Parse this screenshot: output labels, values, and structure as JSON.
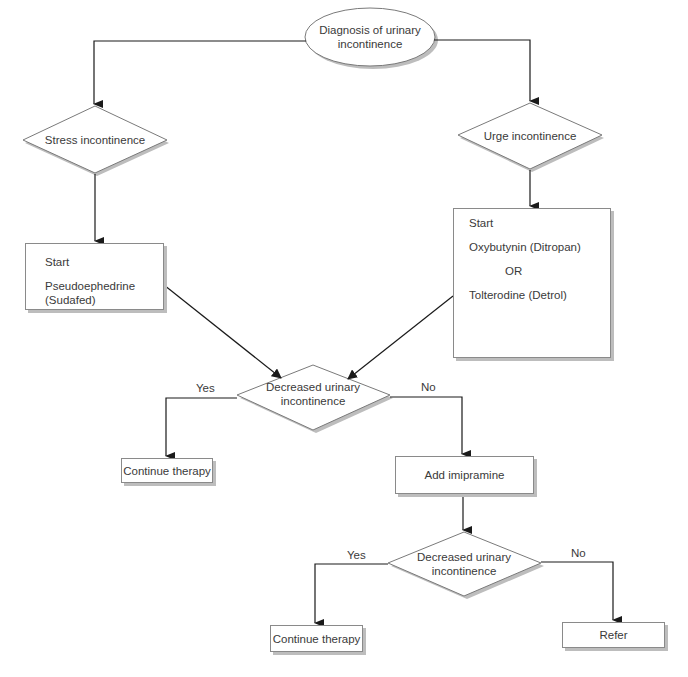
{
  "diagram": {
    "type": "flowchart",
    "start_node": {
      "id": "diagnosis",
      "shape": "ellipse",
      "label": "Diagnosis of urinary incontinence",
      "lines": [
        "Diagnosis of urinary",
        "incontinence"
      ]
    },
    "branches": {
      "stress": {
        "id": "stress",
        "shape": "diamond",
        "label": "Stress incontinence"
      },
      "urge": {
        "id": "urge",
        "shape": "diamond",
        "label": "Urge incontinence"
      }
    },
    "treatments": {
      "stress_start": {
        "id": "stress_start",
        "shape": "rectangle",
        "title": "Start",
        "drug": "Pseudoephedrine",
        "drug_brand": "(Sudafed)"
      },
      "urge_start": {
        "id": "urge_start",
        "shape": "rectangle",
        "title": "Start",
        "option1": "Oxybutynin (Ditropan)",
        "or": "OR",
        "option2": "Tolterodine (Detrol)"
      }
    },
    "decision1": {
      "id": "decision1",
      "shape": "diamond",
      "lines": [
        "Decreased urinary",
        "incontinence"
      ],
      "yes_label": "Yes",
      "no_label": "No"
    },
    "continue1": {
      "id": "continue1",
      "shape": "rectangle",
      "label": "Continue therapy"
    },
    "add_imipramine": {
      "id": "add_imipramine",
      "shape": "rectangle",
      "label": "Add imipramine"
    },
    "decision2": {
      "id": "decision2",
      "shape": "diamond",
      "lines": [
        "Decreased urinary",
        "incontinence"
      ],
      "yes_label": "Yes",
      "no_label": "No"
    },
    "continue2": {
      "id": "continue2",
      "shape": "rectangle",
      "label": "Continue therapy"
    },
    "refer": {
      "id": "refer",
      "shape": "rectangle",
      "label": "Refer"
    },
    "edges": [
      {
        "from": "diagnosis",
        "to": "stress"
      },
      {
        "from": "diagnosis",
        "to": "urge"
      },
      {
        "from": "stress",
        "to": "stress_start"
      },
      {
        "from": "urge",
        "to": "urge_start"
      },
      {
        "from": "stress_start",
        "to": "decision1"
      },
      {
        "from": "urge_start",
        "to": "decision1"
      },
      {
        "from": "decision1",
        "to": "continue1",
        "label": "Yes"
      },
      {
        "from": "decision1",
        "to": "add_imipramine",
        "label": "No"
      },
      {
        "from": "add_imipramine",
        "to": "decision2"
      },
      {
        "from": "decision2",
        "to": "continue2",
        "label": "Yes"
      },
      {
        "from": "decision2",
        "to": "refer",
        "label": "No"
      }
    ]
  },
  "colors": {
    "line": "#2a2a2a",
    "border": "#8a8a8a",
    "shadow": "#bdbdbd",
    "text": "#3a3a3a"
  }
}
